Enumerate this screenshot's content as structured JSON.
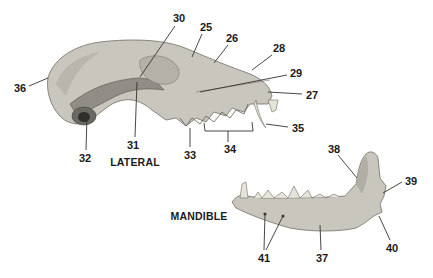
{
  "diagram": {
    "views": [
      {
        "id": "lateral",
        "title": "LATERAL",
        "title_pos": [
          135,
          162
        ]
      },
      {
        "id": "mandible",
        "title": "MANDIBLE",
        "title_pos": [
          199,
          216
        ]
      }
    ],
    "colors": {
      "bone_fill": "#c9c7bd",
      "bone_shade": "#9d9b92",
      "bone_dark": "#5e5c56",
      "tooth": "#e6e3d8",
      "leader": "#333333",
      "text": "#1a1a1a",
      "background": "#ffffff"
    },
    "labels": [
      {
        "id": "25",
        "text": "25",
        "pos": [
          206,
          27
        ],
        "line": [
          [
            202,
            34
          ],
          [
            192,
            57
          ]
        ]
      },
      {
        "id": "26",
        "text": "26",
        "pos": [
          232,
          38
        ],
        "line": [
          [
            228,
            45
          ],
          [
            214,
            63
          ]
        ]
      },
      {
        "id": "27",
        "text": "27",
        "pos": [
          312,
          95
        ],
        "line": [
          [
            302,
            94
          ],
          [
            268,
            92
          ]
        ]
      },
      {
        "id": "28",
        "text": "28",
        "pos": [
          279,
          48
        ],
        "line": [
          [
            272,
            55
          ],
          [
            252,
            70
          ]
        ]
      },
      {
        "id": "29",
        "text": "29",
        "pos": [
          296,
          73
        ],
        "line": [
          [
            287,
            75
          ],
          [
            200,
            92
          ]
        ]
      },
      {
        "id": "30",
        "text": "30",
        "pos": [
          179,
          18
        ],
        "line": [
          [
            175,
            26
          ],
          [
            140,
            77
          ]
        ]
      },
      {
        "id": "31",
        "text": "31",
        "pos": [
          133,
          145
        ],
        "line": [
          [
            135,
            137
          ],
          [
            137,
            82
          ]
        ]
      },
      {
        "id": "32",
        "text": "32",
        "pos": [
          85,
          158
        ],
        "line": [
          [
            86,
            150
          ],
          [
            87,
            115
          ]
        ]
      },
      {
        "id": "33",
        "text": "33",
        "pos": [
          190,
          155
        ],
        "line": [
          [
            190,
            147
          ],
          [
            190,
            128
          ]
        ]
      },
      {
        "id": "34",
        "text": "34",
        "pos": [
          230,
          149
        ],
        "line": [
          [
            228,
            142
          ],
          [
            228,
            131
          ]
        ]
      },
      {
        "id": "35",
        "text": "35",
        "pos": [
          298,
          128
        ],
        "line": [
          [
            288,
            127
          ],
          [
            266,
            124
          ]
        ]
      },
      {
        "id": "36",
        "text": "36",
        "pos": [
          20,
          88
        ],
        "line": [
          [
            29,
            86
          ],
          [
            48,
            78
          ]
        ]
      },
      {
        "id": "37",
        "text": "37",
        "pos": [
          322,
          258
        ],
        "line": [
          [
            321,
            250
          ],
          [
            320,
            225
          ]
        ]
      },
      {
        "id": "38",
        "text": "38",
        "pos": [
          334,
          149
        ],
        "line": [
          [
            338,
            155
          ],
          [
            357,
            178
          ]
        ]
      },
      {
        "id": "39",
        "text": "39",
        "pos": [
          411,
          181
        ],
        "line": [
          [
            402,
            182
          ],
          [
            383,
            193
          ]
        ]
      },
      {
        "id": "40",
        "text": "40",
        "pos": [
          392,
          248
        ],
        "line": [
          [
            390,
            240
          ],
          [
            379,
            216
          ]
        ]
      },
      {
        "id": "41",
        "text": "41",
        "pos": [
          264,
          258
        ],
        "line": [
          [
            264,
            250
          ],
          [
            265,
            214
          ]
        ],
        "line2": [
          [
            266,
            250
          ],
          [
            283,
            216
          ]
        ]
      }
    ],
    "bracket_34": [
      [
        204,
        123
      ],
      [
        205,
        131
      ],
      [
        253,
        131
      ],
      [
        252,
        122
      ]
    ]
  }
}
